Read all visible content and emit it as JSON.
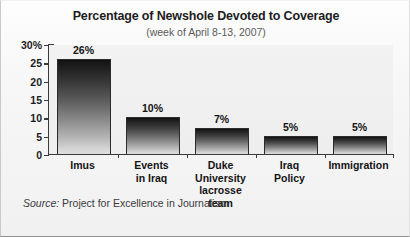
{
  "chart_data": {
    "type": "bar",
    "title": "Percentage of Newshole Devoted to Coverage",
    "subtitle": "(week of April 8-13, 2007)",
    "xlabel": "",
    "ylabel": "",
    "ylim": [
      0,
      30
    ],
    "grid": false,
    "legend": "none",
    "y_ticks": [
      "30%",
      "25",
      "20",
      "15",
      "10",
      "5",
      "0"
    ],
    "y_tick_values": [
      30,
      25,
      20,
      15,
      10,
      5,
      0
    ],
    "categories": [
      "Imus",
      "Events\nin Iraq",
      "Duke University\nlacrosse team",
      "Iraq\nPolicy",
      "Immigration"
    ],
    "category_lines": [
      [
        "Imus"
      ],
      [
        "Events",
        "in Iraq"
      ],
      [
        "Duke University",
        "lacrosse team"
      ],
      [
        "Iraq",
        "Policy"
      ],
      [
        "Immigration"
      ]
    ],
    "values": [
      26,
      10,
      7,
      5,
      5
    ],
    "value_labels": [
      "26%",
      "10%",
      "7%",
      "5%",
      "5%"
    ],
    "bar_gradient": {
      "top": "#121212",
      "bottom": "#dcdcdc"
    },
    "axis_color": "#3a3a3a",
    "plot_background": "#f0f0f0"
  },
  "source": {
    "label": "Source:",
    "text": "Project for Excellence in Journalism"
  }
}
